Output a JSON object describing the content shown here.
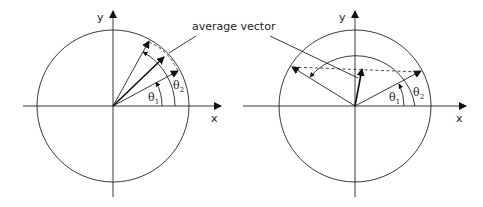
{
  "callout_label": "average vector",
  "diagrams": [
    {
      "id": "left",
      "axis_x_label": "x",
      "axis_y_label": "y",
      "theta1": {
        "symbol": "θ",
        "sub": "1"
      },
      "theta2": {
        "symbol": "θ",
        "sub": "2"
      },
      "vector_angles_deg": [
        30,
        60
      ],
      "average_angle_deg": 45
    },
    {
      "id": "right",
      "axis_x_label": "x",
      "axis_y_label": "y",
      "theta1": {
        "symbol": "θ",
        "sub": "1"
      },
      "theta2": {
        "symbol": "θ",
        "sub": "2"
      },
      "vector_angles_deg": [
        30,
        150
      ],
      "average_angle_deg": 90
    }
  ]
}
